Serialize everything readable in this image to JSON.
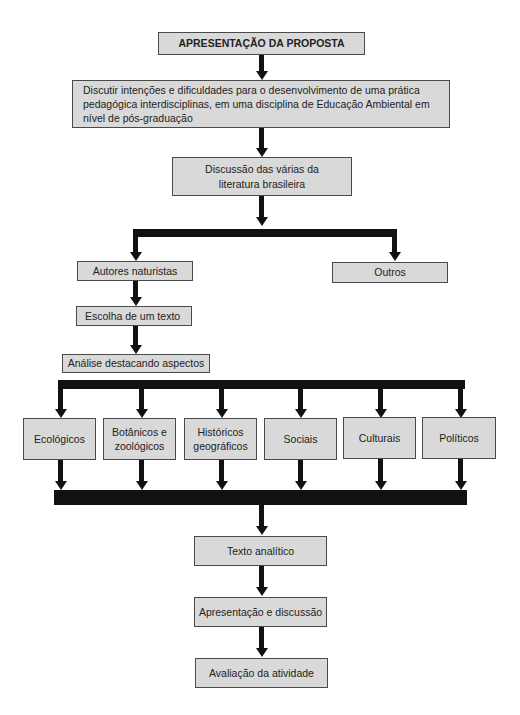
{
  "diagram": {
    "type": "flowchart",
    "colors": {
      "box_fill": "#d9d9d9",
      "box_border": "#4a4a4a",
      "connector": "#111111"
    },
    "nodes": {
      "proposal": "APRESENTAÇÃO DA PROPOSTA",
      "discuss_intentions": "Discutir intenções e dificuldades para o desenvolvimento de uma prática pedagógica interdisciplinas, em uma disciplina de Educação Ambiental em nível de pós-graduação",
      "discuss_literature": "Discussão das várias da literatura brasileira",
      "naturalist_authors": "Autores naturistas",
      "others": "Outros",
      "choose_text": "Escolha de um texto",
      "analysis": "Análise destacando aspectos",
      "aspects": [
        "Ecológicos",
        "Botânicos e zoológicos",
        "Históricos geográficos",
        "Sociais",
        "Culturais",
        "Políticos"
      ],
      "analytic_text": "Texto analítico",
      "presentation": "Apresentação e discussão",
      "evaluation": "Avaliação da atividade"
    },
    "edges": [
      [
        "proposal",
        "discuss_intentions"
      ],
      [
        "discuss_intentions",
        "discuss_literature"
      ],
      [
        "discuss_literature",
        "naturalist_authors"
      ],
      [
        "discuss_literature",
        "others"
      ],
      [
        "naturalist_authors",
        "choose_text"
      ],
      [
        "choose_text",
        "analysis"
      ],
      [
        "analysis",
        "aspects[*]"
      ],
      [
        "aspects[*]",
        "analytic_text"
      ],
      [
        "analytic_text",
        "presentation"
      ],
      [
        "presentation",
        "evaluation"
      ]
    ]
  }
}
